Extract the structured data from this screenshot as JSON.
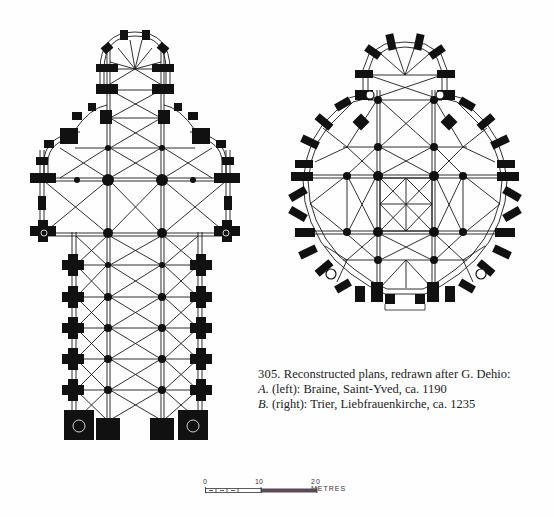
{
  "figure": {
    "number": "305.",
    "title_text": "Reconstructed plans, redrawn after G. Dehio:",
    "items": [
      {
        "letter": "A.",
        "text": " (left): Braine, Saint-Yved, ca. 1190"
      },
      {
        "letter": "B.",
        "text": " (right): Trier, Liebfrauenkirche, ca. 1235"
      }
    ]
  },
  "plans": {
    "a": {
      "name": "Braine, Saint-Yved",
      "position": "left"
    },
    "b": {
      "name": "Trier, Liebfrauenkirche",
      "position": "right"
    }
  },
  "scale_bar": {
    "labels": [
      "0",
      "10",
      "20 METRES"
    ],
    "color_filled": "#5a4a55",
    "color_outline": "#333333"
  },
  "colors": {
    "wall": "#111111",
    "line": "#1a1a1a",
    "background": "#fefefe"
  }
}
